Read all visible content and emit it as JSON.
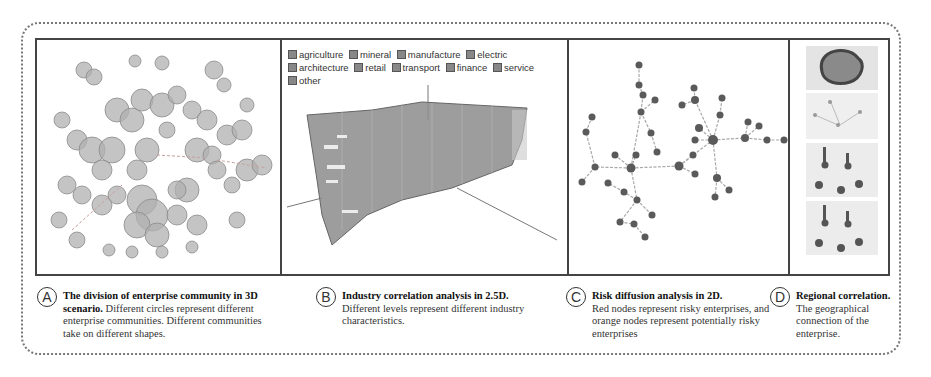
{
  "figure": {
    "panels": [
      {
        "id": "A",
        "name": "enterprise-community-3d",
        "visual": "3D scatter of semi-transparent grey circles clustered into communities"
      },
      {
        "id": "B",
        "name": "industry-correlation-2-5d",
        "legend": [
          {
            "label": "agriculture",
            "checked": true
          },
          {
            "label": "mineral",
            "checked": true
          },
          {
            "label": "manufacture",
            "checked": true
          },
          {
            "label": "electric",
            "checked": true
          },
          {
            "label": "architecture",
            "checked": true
          },
          {
            "label": "retail",
            "checked": true
          },
          {
            "label": "transport",
            "checked": true
          },
          {
            "label": "finance",
            "checked": true
          },
          {
            "label": "service",
            "checked": true
          },
          {
            "label": "other",
            "checked": true
          }
        ]
      },
      {
        "id": "C",
        "name": "risk-diffusion-2d",
        "visual": "Node-link tree graph of enterprises"
      },
      {
        "id": "D",
        "name": "regional-correlation",
        "visual": "Four stacked map thumbnails"
      }
    ],
    "captions": [
      {
        "letter": "A",
        "title": "The division of enterprise community in 3D scenario.",
        "body": " Different circles represent different enterprise communities. Different communities take on different shapes."
      },
      {
        "letter": "B",
        "title": "Industry correlation analysis in 2.5D.",
        "body": " Different levels represent different industry characteristics."
      },
      {
        "letter": "C",
        "title": "Risk diffusion analysis in 2D.",
        "body": " Red nodes represent risky enterprises, and orange nodes represent potentially risky enterprises"
      },
      {
        "letter": "D",
        "title": "Regional correlation.",
        "body": " The geographical connection of the enterprise."
      }
    ],
    "colors": {
      "frame": "#444444",
      "outer_dotted": "#777777",
      "circle_fill": "#a8a8a8",
      "node_fill": "#555555",
      "edge": "#9a9a9a"
    }
  }
}
